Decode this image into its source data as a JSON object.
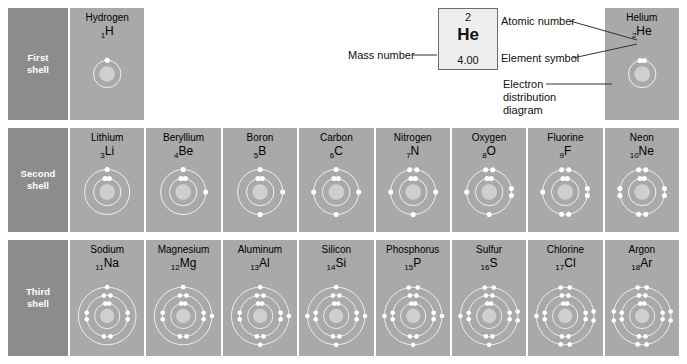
{
  "colors": {
    "cell_bg": "#a9a9a9",
    "label_bg": "#8c8c8c",
    "label_text": "#ffffff",
    "electron": "#ffffff",
    "nucleus": "#c9c9c9",
    "callout_bg": "#eeeeee",
    "callout_border": "#6d6d6d"
  },
  "shell_rows": [
    {
      "label": "First\nshell",
      "line1": "First",
      "line2": "shell"
    },
    {
      "label": "Second\nshell",
      "line1": "Second",
      "line2": "shell"
    },
    {
      "label": "Third\nshell",
      "line1": "Third",
      "line2": "shell"
    }
  ],
  "callout": {
    "atomic_number": "2",
    "symbol": "He",
    "mass_number": "4.00",
    "annotations": {
      "mass_number_label": "Mass number",
      "atomic_number_label": "Atomic number",
      "element_symbol_label": "Element symbol",
      "electron_distribution_label": "Electron distribution diagram",
      "electron_distribution_lines": [
        "Electron",
        "distribution",
        "diagram"
      ]
    }
  },
  "rows": [
    {
      "shell": "First shell",
      "cells": [
        {
          "name": "Hydrogen",
          "number": "1",
          "symbol": "H",
          "shells": [
            1
          ]
        },
        {
          "empty": true
        },
        {
          "empty": true
        },
        {
          "empty": true
        },
        {
          "empty": true
        },
        {
          "empty": true
        },
        {
          "empty": true
        },
        {
          "name": "Helium",
          "number": "2",
          "symbol": "He",
          "shells": [
            2
          ]
        }
      ]
    },
    {
      "shell": "Second shell",
      "cells": [
        {
          "name": "Lithium",
          "number": "3",
          "symbol": "Li",
          "shells": [
            2,
            1
          ]
        },
        {
          "name": "Beryllium",
          "number": "4",
          "symbol": "Be",
          "shells": [
            2,
            2
          ]
        },
        {
          "name": "Boron",
          "number": "5",
          "symbol": "B",
          "shells": [
            2,
            3
          ]
        },
        {
          "name": "Carbon",
          "number": "6",
          "symbol": "C",
          "shells": [
            2,
            4
          ]
        },
        {
          "name": "Nitrogen",
          "number": "7",
          "symbol": "N",
          "shells": [
            2,
            5
          ]
        },
        {
          "name": "Oxygen",
          "number": "8",
          "symbol": "O",
          "shells": [
            2,
            6
          ]
        },
        {
          "name": "Fluorine",
          "number": "9",
          "symbol": "F",
          "shells": [
            2,
            7
          ]
        },
        {
          "name": "Neon",
          "number": "10",
          "symbol": "Ne",
          "shells": [
            2,
            8
          ]
        }
      ]
    },
    {
      "shell": "Third shell",
      "cells": [
        {
          "name": "Sodium",
          "number": "11",
          "symbol": "Na",
          "shells": [
            2,
            8,
            1
          ]
        },
        {
          "name": "Magnesium",
          "number": "12",
          "symbol": "Mg",
          "shells": [
            2,
            8,
            2
          ]
        },
        {
          "name": "Aluminum",
          "number": "13",
          "symbol": "Al",
          "shells": [
            2,
            8,
            3
          ]
        },
        {
          "name": "Silicon",
          "number": "14",
          "symbol": "Si",
          "shells": [
            2,
            8,
            4
          ]
        },
        {
          "name": "Phosphorus",
          "number": "15",
          "symbol": "P",
          "shells": [
            2,
            8,
            5
          ]
        },
        {
          "name": "Sulfur",
          "number": "16",
          "symbol": "S",
          "shells": [
            2,
            8,
            6
          ]
        },
        {
          "name": "Chlorine",
          "number": "17",
          "symbol": "Cl",
          "shells": [
            2,
            8,
            7
          ]
        },
        {
          "name": "Argon",
          "number": "18",
          "symbol": "Ar",
          "shells": [
            2,
            8,
            8
          ]
        }
      ]
    }
  ]
}
